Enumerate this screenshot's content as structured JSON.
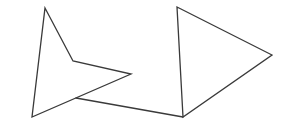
{
  "canvas": {
    "width": 290,
    "height": 128,
    "background": "#ffffff",
    "stroke_color": "#3a3a3a"
  },
  "shapes": [
    {
      "name": "left-arrowhead-shape",
      "type": "polygon",
      "points": "45,8 73,61 131,74 32,117"
    },
    {
      "name": "connector-line",
      "type": "line",
      "points": "76,98 183,117"
    },
    {
      "name": "right-triangle-shape",
      "type": "polygon",
      "points": "177,7 272,55 183,117"
    }
  ]
}
